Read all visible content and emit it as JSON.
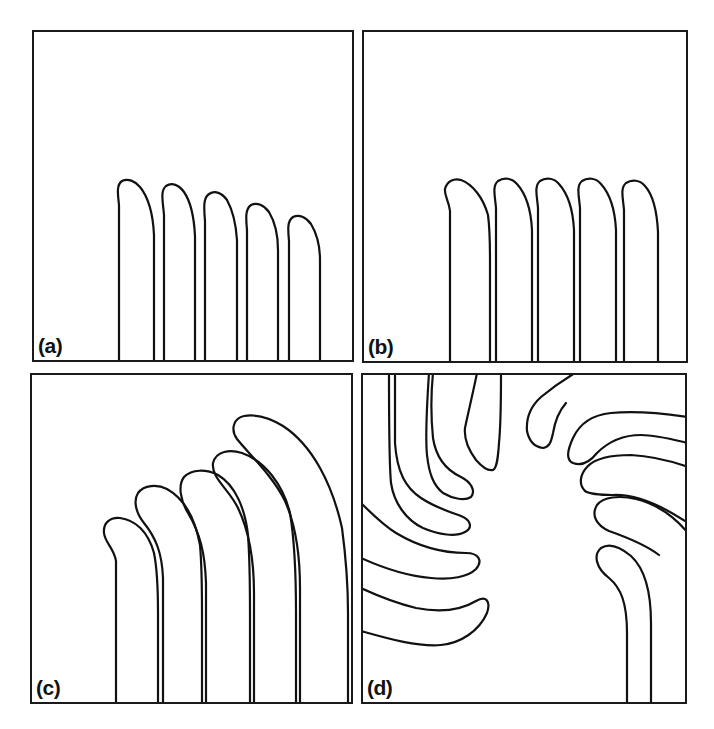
{
  "figure": {
    "panels": [
      {
        "id": "a",
        "label": "(a)",
        "box": {
          "x": 32,
          "y": 30,
          "w": 322,
          "h": 332
        },
        "fingers": [
          "M87,331 L87,175 C86,165 84,155 90,151 C96,148 103,151 108,157 C117,168 121,184 122,205 L122,331",
          "M132,331 L132,185 C131,172 128,161 134,156 C140,152 147,155 152,162 C159,172 162,186 163,206 L163,331",
          "M173,331 L173,191 C172,178 171,168 177,164 C183,160 190,163 195,170 C201,181 204,194 205,210 L205,331",
          "M215,331 L215,200 C214,189 213,179 219,175 C225,172 232,175 237,182 C243,192 246,205 246,220 L246,331",
          "M257,331 L257,211 C256,200 255,191 261,187 C267,184 274,187 279,194 C285,204 288,216 288,230 L288,331"
        ]
      },
      {
        "id": "b",
        "label": "(b)",
        "box": {
          "x": 362,
          "y": 30,
          "w": 326,
          "h": 333
        },
        "fingers": [
          "M88,332 L88,181 C87,171 82,165 83,159 C85,151 92,148 99,150 C110,154 121,167 126,185 C128,200 128,215 128,230 L128,332",
          "M134,332 L134,178 C133,166 130,156 136,151 C142,147 150,148 155,154 C164,164 169,180 170,200 L170,332",
          "M176,332 L176,178 C175,166 172,156 178,151 C184,147 192,148 197,154 C206,164 211,180 212,200 L212,332",
          "M218,332 L218,178 C217,166 214,156 220,151 C226,147 234,148 239,154 C248,164 253,180 254,200 L254,332",
          "M262,332 L262,180 C261,168 258,158 264,153 C270,149 278,150 283,156 C292,166 295,182 296,202 L296,332"
        ]
      },
      {
        "id": "c",
        "label": "(c)",
        "box": {
          "x": 30,
          "y": 373,
          "w": 323,
          "h": 331
        },
        "fingers": [
          "M86,330 L86,188 C84,175 75,170 74,160 C73,150 80,144 90,145 C105,147 118,158 124,180 C128,200 128,220 128,240 L128,330",
          "M133,330 L133,205 C132,180 126,165 114,150 C106,140 103,128 108,120 C114,112 127,111 137,116 C155,126 165,145 170,172 C172,195 172,215 172,240 L172,330",
          "M176,330 L176,210 C175,180 170,160 158,140 C150,127 148,112 154,104 C162,96 176,96 188,102 C205,112 215,135 218,162 C220,190 220,215 220,240 L220,330",
          "M224,330 L224,220 C224,190 220,160 208,135 C199,116 181,105 183,90 C186,78 200,76 212,80 C235,88 253,112 260,140 C265,170 266,200 266,240 L266,330",
          "M270,330 L270,215 C270,185 267,155 255,128 C243,103 218,80 207,66 C200,56 204,45 214,43 C226,41 240,45 253,53 C282,72 302,110 312,155 C316,185 318,215 318,240 L318,330"
        ]
      },
      {
        "id": "d",
        "label": "(d)",
        "box": {
          "x": 361,
          "y": 373,
          "w": 326,
          "h": 331
        },
        "fingers": [
          "M34,0 L34,70 C36,100 45,115 60,125 C75,135 92,140 100,143 C110,147 112,155 104,159 C95,164 78,162 62,155 C45,147 33,130 30,110 C28,90 28,60 28,0",
          "M72,0 C70,20 70,45 72,65 C75,85 85,97 100,104 C110,109 115,118 110,124 C104,128 92,126 82,120 C72,112 68,100 66,82 C64,62 66,30 68,0",
          "M116,0 C112,20 107,40 104,55 C103,65 106,75 115,87 C122,95 128,98 132,97 C136,95 137,85 138,70 C140,50 140,30 140,0",
          "M214,0 C204,6 192,14 180,24 C170,33 165,45 166,58 C168,68 174,74 182,75 C188,74 190,70 192,60 C194,48 198,38 205,30",
          "M0,0",
          "M327,44 C300,40 270,38 250,40 C230,42 218,52 212,65 C206,78 205,87 212,90 C220,93 228,90 236,80 C248,68 262,62 280,62 C295,62 310,66 327,70",
          "M327,94 C310,88 290,83 270,82 C250,82 235,85 227,93 C218,102 218,112 224,118 C230,122 242,122 252,122 C275,121 300,132 327,150",
          "M327,160 C312,142 295,131 275,126 C258,122 242,124 236,132 C230,142 235,152 248,158 C265,164 285,172 298,182",
          "M290,330 L290,250 C290,215 283,195 270,183 C258,173 248,170 240,175 C232,182 235,195 248,205 C260,215 266,230 266,260 L266,330",
          "M0,130 C10,140 22,152 35,160 C55,172 78,180 105,180 C118,180 122,188 115,196 C107,204 90,207 70,205 C45,203 22,195 0,185",
          "M0,215 C15,222 35,230 55,235 C80,240 100,237 115,228 C125,222 130,228 126,240 C118,258 100,270 80,272 C55,274 25,265 0,258"
        ]
      }
    ]
  }
}
